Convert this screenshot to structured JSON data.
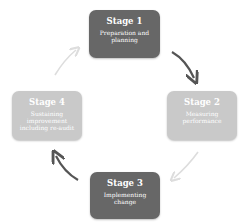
{
  "stages": [
    {
      "title": "Stage 1",
      "description": "Preparation and planning",
      "color": "#676767"
    },
    {
      "title": "Stage 2",
      "description": "Measuring performance",
      "color": "#c9c9c9"
    },
    {
      "title": "Stage 3",
      "description": "Implementing change",
      "color": "#676767"
    },
    {
      "title": "Stage 4",
      "description": "Sustaining improvement including re-audit",
      "color": "#c9c9c9"
    }
  ],
  "arrows": [
    {
      "from": "Stage 1",
      "to": "Stage 2",
      "color": "#555555"
    },
    {
      "from": "Stage 2",
      "to": "Stage 3",
      "color": "#dddddd"
    },
    {
      "from": "Stage 3",
      "to": "Stage 4",
      "color": "#555555"
    },
    {
      "from": "Stage 4",
      "to": "Stage 1",
      "color": "#dddddd"
    }
  ]
}
